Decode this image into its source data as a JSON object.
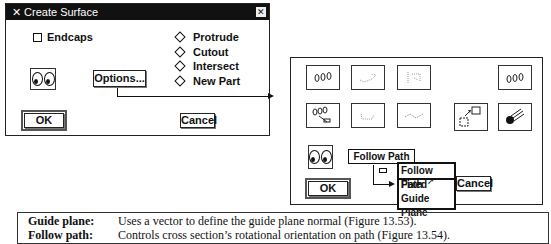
{
  "create_surface_dialog": {
    "title": "Create Surface",
    "title_icon": "x-logo-icon",
    "close_glyph": "✕",
    "endcaps_label": "Endcaps",
    "endcaps_checked": false,
    "operation_options": [
      {
        "label": "Protrude",
        "selected": false
      },
      {
        "label": "Cutout",
        "selected": false
      },
      {
        "label": "Intersect",
        "selected": false
      },
      {
        "label": "New Part",
        "selected": false
      }
    ],
    "options_button": "Options...",
    "ok_button": "OK",
    "cancel_button": "Cancel"
  },
  "options_dialog": {
    "icon_buttons_row1": [
      "pegs-icon",
      "curve-a-icon",
      "curve-b-icon",
      "pegs-alt-icon"
    ],
    "icon_buttons_row2": [
      "pegs-arrow-icon",
      "curve-c-icon",
      "curve-d-icon",
      "move-box-icon",
      "comet-icon"
    ],
    "orientation_select": {
      "value": "Follow Path",
      "options": [
        "Follow Path",
        "Fixed",
        "Guide Plane"
      ],
      "highlighted": "Follow Path"
    },
    "ok_button": "OK",
    "cancel_button": "Cancel"
  },
  "descriptions": [
    {
      "term": "Guide plane:",
      "text": "Uses a vector to define the guide plane normal (Figure 13.53)."
    },
    {
      "term": "Follow path:",
      "text": "Controls cross section’s rotational orientation on path (Figure 13.54)."
    }
  ]
}
